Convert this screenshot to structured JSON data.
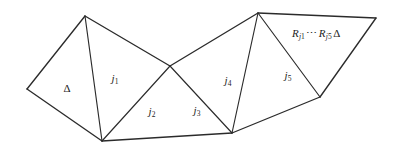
{
  "figure": {
    "type": "triangulated-polygon-diagram",
    "background_color": "#ffffff",
    "line_color": "#2b2b2b",
    "text_color": "#1d1d1d",
    "canvas": {
      "width": 393,
      "height": 154
    },
    "vertices": {
      "A": {
        "x": 27,
        "y": 89,
        "name": "left-vertex"
      },
      "B": {
        "x": 85,
        "y": 16,
        "name": "top-left-vertex"
      },
      "C": {
        "x": 102,
        "y": 141,
        "name": "bottom-left-vertex"
      },
      "D": {
        "x": 170,
        "y": 66,
        "name": "center-crossing-vertex"
      },
      "E": {
        "x": 232,
        "y": 133,
        "name": "bottom-right-vertex"
      },
      "F": {
        "x": 258,
        "y": 13,
        "name": "top-apex-vertex"
      },
      "G": {
        "x": 320,
        "y": 97,
        "name": "lower-right-vertex"
      },
      "H": {
        "x": 376,
        "y": 18,
        "name": "far-right-vertex"
      }
    },
    "edges": [
      {
        "from": "A",
        "to": "B",
        "kind": "boundary"
      },
      {
        "from": "A",
        "to": "C",
        "kind": "boundary"
      },
      {
        "from": "B",
        "to": "C",
        "kind": "interior"
      },
      {
        "from": "B",
        "to": "D",
        "kind": "boundary"
      },
      {
        "from": "C",
        "to": "D",
        "kind": "interior"
      },
      {
        "from": "C",
        "to": "E",
        "kind": "boundary"
      },
      {
        "from": "D",
        "to": "E",
        "kind": "interior"
      },
      {
        "from": "D",
        "to": "F",
        "kind": "boundary"
      },
      {
        "from": "E",
        "to": "F",
        "kind": "interior"
      },
      {
        "from": "E",
        "to": "G",
        "kind": "boundary"
      },
      {
        "from": "F",
        "to": "G",
        "kind": "interior"
      },
      {
        "from": "F",
        "to": "H",
        "kind": "boundary"
      },
      {
        "from": "G",
        "to": "H",
        "kind": "boundary"
      }
    ],
    "labels": [
      {
        "id": "delta-left",
        "name": "triangle-label-delta",
        "text": "Δ",
        "style": "delta",
        "x": 67,
        "y": 88
      },
      {
        "id": "j1",
        "name": "edge-label-j1",
        "base": "j",
        "subscript": "1",
        "style": "var",
        "x": 115,
        "y": 78
      },
      {
        "id": "j2",
        "name": "edge-label-j2",
        "base": "j",
        "subscript": "2",
        "style": "var",
        "x": 152,
        "y": 111
      },
      {
        "id": "j3",
        "name": "edge-label-j3",
        "base": "j",
        "subscript": "3",
        "style": "var",
        "x": 197,
        "y": 110
      },
      {
        "id": "j4",
        "name": "edge-label-j4",
        "base": "j",
        "subscript": "4",
        "style": "var",
        "x": 228,
        "y": 80
      },
      {
        "id": "j5",
        "name": "edge-label-j5",
        "base": "j",
        "subscript": "5",
        "style": "var",
        "x": 288,
        "y": 75
      }
    ],
    "expression": {
      "name": "triangle-label-r-expression",
      "full_text": "R_{j1} ⋯ R_{j5} Δ",
      "r1_base": "R",
      "r1_sub": "j",
      "r1_sub_index": "1",
      "dots": "⋯",
      "r2_base": "R",
      "r2_sub": "j",
      "r2_sub_index": "5",
      "delta": "Δ",
      "x": 317,
      "y": 33
    }
  }
}
